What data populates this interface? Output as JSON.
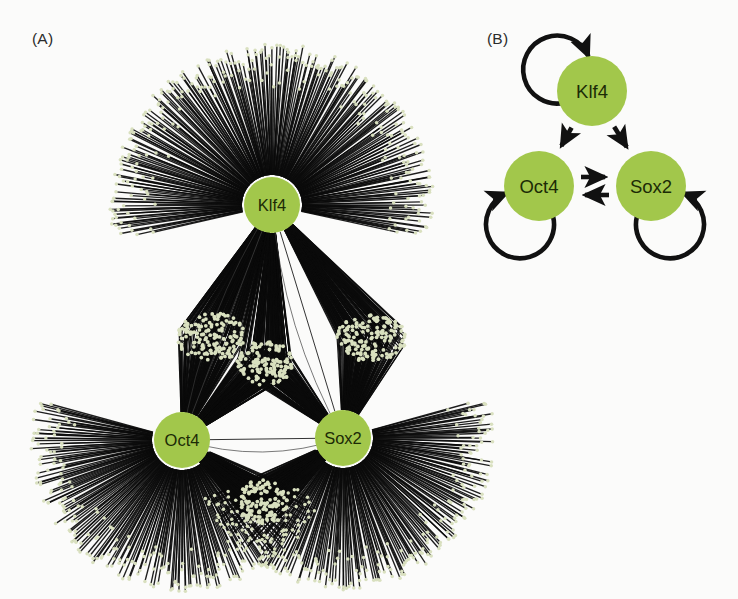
{
  "figure": {
    "background_color": "#fbfbfa",
    "width": 738,
    "height": 599
  },
  "palette": {
    "hub_fill": "#a2c74b",
    "hub_fill_dark": "#93ba3d",
    "hub_label_color": "#1c2b06",
    "target_node_fill": "#d9e0bf",
    "edge_color": "#0b0b0b",
    "diagram_arrow_color": "#111111",
    "panel_label_color": "#2b2b2b"
  },
  "panels": [
    {
      "id": "A",
      "label": "(A)",
      "type": "hairball-network",
      "description": "Genome-wide target network of three pluripotency transcription factors"
    },
    {
      "id": "B",
      "label": "(B)",
      "type": "regulatory-circuit",
      "description": "Simplified core regulatory circuit"
    }
  ],
  "panel_a": {
    "label": "(A)",
    "hubs": [
      {
        "id": "klf4",
        "label": "Klf4",
        "cx": 272,
        "cy": 205,
        "r": 28
      },
      {
        "id": "oct4",
        "label": "Oct4",
        "cx": 182,
        "cy": 440,
        "r": 28
      },
      {
        "id": "sox2",
        "label": "Sox2",
        "cx": 343,
        "cy": 438,
        "r": 28
      }
    ],
    "fans": [
      {
        "id": "klf4-exclusive",
        "hub": "klf4",
        "start_angle_deg": 167,
        "end_angle_deg": 373,
        "radius_inner": 30,
        "radius_outer": 162,
        "count": 300
      },
      {
        "id": "oct4-exclusive",
        "hub": "oct4",
        "start_angle_deg": 23,
        "end_angle_deg": 196,
        "radius_inner": 30,
        "radius_outer": 152,
        "count": 235
      },
      {
        "id": "sox2-exclusive",
        "hub": "sox2",
        "start_angle_deg": -16,
        "end_angle_deg": 157,
        "radius_inner": 30,
        "radius_outer": 152,
        "count": 235
      }
    ],
    "shared_clusters": [
      {
        "id": "klf4-oct4-shared",
        "label": "Klf4 and Oct4 shared targets",
        "cx": 212,
        "cy": 337,
        "rx": 36,
        "ry": 24,
        "count": 150,
        "linked_hubs": [
          "klf4",
          "oct4"
        ]
      },
      {
        "id": "klf4-sox2-shared",
        "label": "Klf4 and Sox2 shared targets",
        "cx": 372,
        "cy": 338,
        "rx": 36,
        "ry": 24,
        "count": 150,
        "linked_hubs": [
          "klf4",
          "sox2"
        ]
      },
      {
        "id": "klf4-oct4-sox2-shared",
        "label": "Klf4, Oct4 and Sox2 shared targets",
        "cx": 265,
        "cy": 363,
        "rx": 28,
        "ry": 22,
        "count": 130,
        "linked_hubs": [
          "klf4",
          "oct4",
          "sox2"
        ]
      },
      {
        "id": "oct4-sox2-shared",
        "label": "Oct4 and Sox2 shared targets",
        "cx": 262,
        "cy": 503,
        "rx": 26,
        "ry": 24,
        "count": 130,
        "linked_hubs": [
          "oct4",
          "sox2"
        ]
      }
    ],
    "hub_links": [
      {
        "from": "oct4",
        "to": "sox2"
      },
      {
        "from": "klf4",
        "to": "oct4"
      },
      {
        "from": "klf4",
        "to": "sox2"
      }
    ]
  },
  "panel_b": {
    "label": "(B)",
    "nodes": [
      {
        "id": "klf4",
        "label": "Klf4",
        "cx": 592,
        "cy": 91,
        "r": 35
      },
      {
        "id": "oct4",
        "label": "Oct4",
        "cx": 539,
        "cy": 186,
        "r": 35
      },
      {
        "id": "sox2",
        "label": "Sox2",
        "cx": 651,
        "cy": 186,
        "r": 35
      }
    ],
    "edges": [
      {
        "id": "klf4-self",
        "from": "klf4",
        "to": "klf4",
        "type": "self-loop",
        "side": "upper-left"
      },
      {
        "id": "oct4-self",
        "from": "oct4",
        "to": "oct4",
        "type": "self-loop",
        "side": "lower-left"
      },
      {
        "id": "sox2-self",
        "from": "sox2",
        "to": "sox2",
        "type": "self-loop",
        "side": "lower-right"
      },
      {
        "id": "klf4-to-oct4",
        "from": "klf4",
        "to": "oct4",
        "type": "directed"
      },
      {
        "id": "klf4-to-sox2",
        "from": "klf4",
        "to": "sox2",
        "type": "directed"
      },
      {
        "id": "oct4-to-sox2",
        "from": "oct4",
        "to": "sox2",
        "type": "directed"
      },
      {
        "id": "sox2-to-oct4",
        "from": "sox2",
        "to": "oct4",
        "type": "directed"
      }
    ]
  }
}
